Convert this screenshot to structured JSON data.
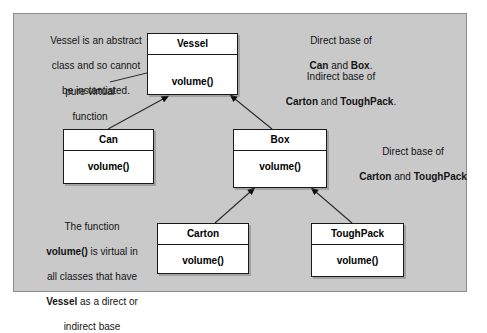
{
  "diagram": {
    "type": "uml-class-diagram",
    "background_color": "#c9c9c9",
    "box_fill_color": "#ffffff",
    "line_color": "#1a1a1a",
    "classes": [
      {
        "id": "vessel",
        "name": "Vessel",
        "members": [
          "volume()"
        ],
        "abstract": true
      },
      {
        "id": "can",
        "name": "Can",
        "members": [
          "volume()"
        ],
        "abstract": false
      },
      {
        "id": "box",
        "name": "Box",
        "members": [
          "volume()"
        ],
        "abstract": false
      },
      {
        "id": "carton",
        "name": "Carton",
        "members": [
          "volume()"
        ],
        "abstract": false
      },
      {
        "id": "toughpack",
        "name": "ToughPack",
        "members": [
          "volume()"
        ],
        "abstract": false
      }
    ],
    "inheritance": [
      {
        "from": "Can",
        "to": "Vessel"
      },
      {
        "from": "Box",
        "to": "Vessel"
      },
      {
        "from": "Carton",
        "to": "Box"
      },
      {
        "from": "ToughPack",
        "to": "Box"
      }
    ]
  },
  "notes": {
    "abstract": {
      "line1": "Vessel is an abstract",
      "line2": "class and so cannot",
      "line3": "be instantiated."
    },
    "pure_virtual": {
      "line1": "pure virtual",
      "line2": "function"
    },
    "direct_base": {
      "line1": "Direct base of",
      "bold1": "Can",
      "mid1": " and ",
      "bold2": "Box",
      "tail1": "."
    },
    "indirect_base": {
      "line1": "Indirect base of",
      "bold1": "Carton",
      "mid1": " and ",
      "bold2": "ToughPack",
      "tail1": "."
    },
    "direct_base_2": {
      "line1": "Direct base of",
      "bold1": "Carton",
      "mid1": " and ",
      "bold2": "ToughPack"
    },
    "virtual_function": {
      "l1a": "The function",
      "l2bold": "volume()",
      "l2rest": " is virtual in",
      "l3": "all classes that have",
      "l4bold": "Vessel",
      "l4rest": " as a direct or",
      "l5": "indirect base"
    }
  }
}
